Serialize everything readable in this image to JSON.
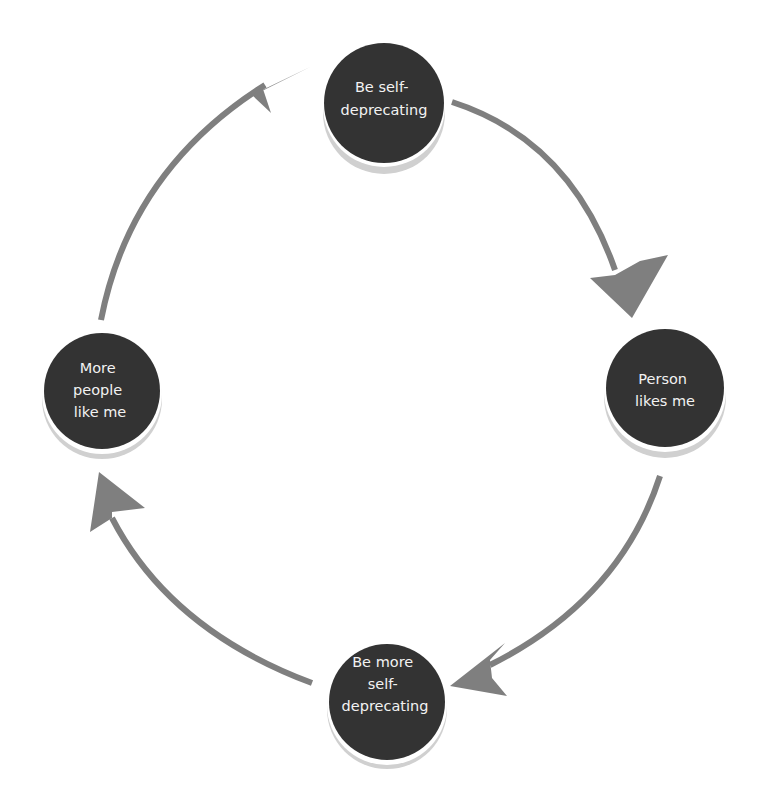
{
  "diagram": {
    "type": "cycle",
    "colors": {
      "node_fill": "#333333",
      "node_shadow": "#cfcfcf",
      "node_text": "#f2f2f2",
      "arrow": "#7f7f7f",
      "background": "#ffffff"
    },
    "nodes": [
      {
        "id": "top",
        "lines": [
          "Be self-",
          "deprecating"
        ]
      },
      {
        "id": "right",
        "lines": [
          "Person",
          "likes me"
        ]
      },
      {
        "id": "bottom",
        "lines": [
          "Be more",
          "self-",
          "deprecating"
        ]
      },
      {
        "id": "left",
        "lines": [
          "More",
          "people",
          "like me"
        ]
      }
    ],
    "edges": [
      {
        "from": "top",
        "to": "right"
      },
      {
        "from": "right",
        "to": "bottom"
      },
      {
        "from": "bottom",
        "to": "left"
      },
      {
        "from": "left",
        "to": "top"
      }
    ]
  }
}
